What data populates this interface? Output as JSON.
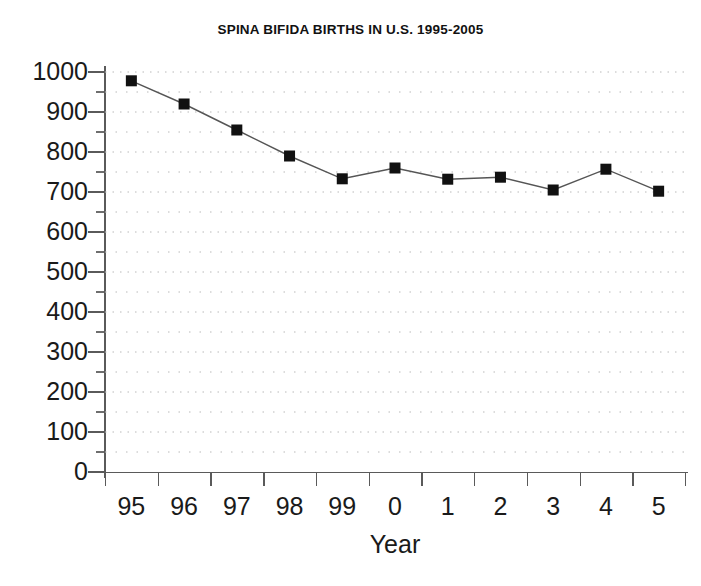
{
  "chart_data": {
    "type": "line",
    "title": "SPINA BIFIDA BIRTHS IN U.S. 1995-2005",
    "xlabel": "Year",
    "ylabel": "",
    "categories": [
      "95",
      "96",
      "97",
      "98",
      "99",
      "0",
      "1",
      "2",
      "3",
      "4",
      "5"
    ],
    "values": [
      978,
      920,
      855,
      790,
      733,
      760,
      732,
      737,
      705,
      757,
      702
    ],
    "series": [
      {
        "name": "Spina bifida births",
        "values": [
          978,
          920,
          855,
          790,
          733,
          760,
          732,
          737,
          705,
          757,
          702
        ]
      }
    ],
    "ylim": [
      0,
      1000
    ],
    "y_ticks": [
      0,
      100,
      200,
      300,
      400,
      500,
      600,
      700,
      800,
      900,
      1000
    ],
    "y_tick_labels": [
      "0",
      "100",
      "200",
      "300",
      "400",
      "500",
      "600",
      "700",
      "800",
      "900",
      "1000"
    ],
    "y_minor_tick_interval": 50,
    "grid": "horizontal-dotted-minor-and-major",
    "legend": "none",
    "marker": "filled-square",
    "line_color": "#555555",
    "marker_color": "#111111",
    "grid_color": "#b9b9b9",
    "axis_color": "#5a5a5a"
  },
  "axes": {
    "x_title": "Year",
    "y_title": ""
  }
}
